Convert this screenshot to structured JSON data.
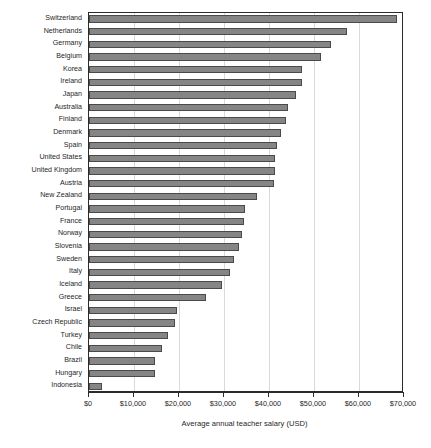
{
  "chart_data": {
    "type": "bar",
    "orientation": "horizontal",
    "title": "",
    "xlabel": "Average annual teacher salary (USD)",
    "ylabel": "",
    "xlim": [
      0,
      70000
    ],
    "xtick_labels": [
      "$0",
      "$10,000",
      "$20,000",
      "$30,000",
      "$40,000",
      "$50,000",
      "$60,000",
      "$70,000"
    ],
    "xtick_values": [
      0,
      10000,
      20000,
      30000,
      40000,
      50000,
      60000,
      70000
    ],
    "grid": "vertical",
    "legend": "none",
    "bar_color": "#858585",
    "bar_edge_color": "#4a4a4a",
    "categories": [
      "Switzerland",
      "Netherlands",
      "Germany",
      "Belgium",
      "Korea",
      "Ireland",
      "Japan",
      "Australia",
      "Finland",
      "Denmark",
      "Spain",
      "United States",
      "United Kingdom",
      "Austria",
      "New Zealand",
      "Portugal",
      "France",
      "Norway",
      "Slovenia",
      "Sweden",
      "Italy",
      "Iceland",
      "Greece",
      "Israel",
      "Czech Republic",
      "Turkey",
      "Chile",
      "Brazil",
      "Hungary",
      "Indonesia"
    ],
    "values": [
      68400,
      57400,
      53700,
      51500,
      47400,
      47300,
      46000,
      44300,
      43800,
      42700,
      41800,
      41400,
      41300,
      41000,
      37400,
      34600,
      34400,
      34000,
      33300,
      32300,
      31300,
      29600,
      26100,
      19500,
      19000,
      17500,
      16300,
      14700,
      14600,
      2800
    ]
  }
}
